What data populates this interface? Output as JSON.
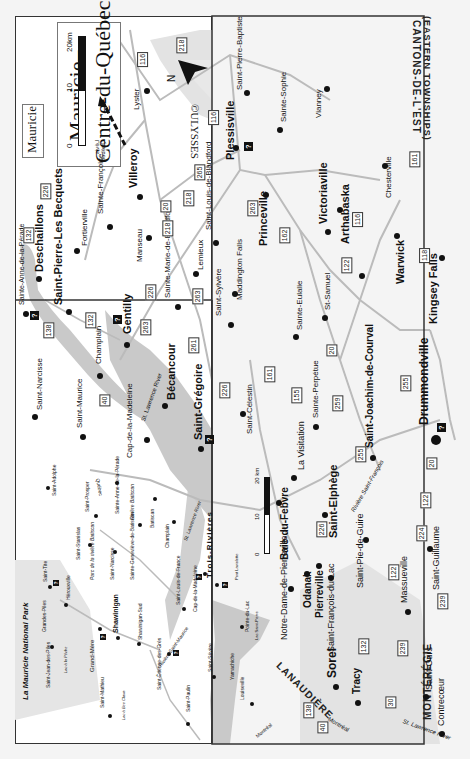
{
  "main_map": {
    "title_line1": "Mauricie–",
    "title_line2": "Centre-du-Québec",
    "scale": {
      "zero": "0",
      "mid": "10",
      "end": "20km"
    },
    "north_label": "N",
    "copyright": "©ULYSSES",
    "region_labels": {
      "eastern_townships_fr": "CANTONS-DE-L'EST",
      "eastern_townships_en": "(EASTERN TOWNSHIPS)",
      "monteregie": "MONTÉRÉGIE",
      "lanaudiere": "LANAUDIÈRE"
    },
    "direction_arrows": {
      "quebec": "Québec",
      "levis": "Lévis",
      "montreal": "Montréal"
    },
    "rivers": {
      "st_lawrence": "St. Lawrence River",
      "saint_francois": "Rivière Saint-François"
    },
    "places": {
      "lyster": "Lyster",
      "plessisville": "Plessisville",
      "saint_pierre_baptiste": "Saint-Pierre-Baptiste",
      "sainte_sophie": "Sainte-Sophie",
      "vianney": "Vianney",
      "chesterville": "Chesterville",
      "villeroy": "Villeroy",
      "sainte_francoise": "Sainte-Françoise",
      "fortierville": "Fortierville",
      "deschaillons": "Deschaillons",
      "saint_pierre_les_becquets": "Saint-Pierre-Les Becquets",
      "manseau": "Manseau",
      "saint_louis_de_blandford": "Saint-Louis-de-Blandford",
      "lemieux": "Lemieux",
      "sainte_marie_de_blandford": "Sainte-Marie-de-Blandford",
      "princeville": "Princeville",
      "victoriaville": "Victoriaville",
      "arthabaska": "Arthabaska",
      "warwick": "Warwick",
      "kingsey_falls": "Kingsey Falls",
      "maddington_falls": "Maddington Falls",
      "saint_sylvere": "Saint-Sylvère",
      "sainte_eulalie": "Sainte-Eulalie",
      "st_samuel": "St-Samuel",
      "gentilly": "Gentilly",
      "sainte_anne_de_la_perade": "Sainte-Anne-de-la-Pérade",
      "champlain": "Champlain",
      "saint_narcisse": "Saint-Narcisse",
      "saint_maurice": "Saint-Maurice",
      "becancour": "Bécancour",
      "saint_gregoire": "Saint-Grégoire",
      "cap_de_la_madeleine": "Cap-de-la-Madeleine",
      "saint_celestin": "Saint-Célestin",
      "sainte_perpetue": "Sainte-Perpétue",
      "la_visitation": "La Visitation",
      "saint_joachim_de_courval": "Saint-Joachim-de-Courval",
      "drummondville": "Drummondville",
      "baie_du_febvre": "Baie-du-Febvre",
      "saint_elphege": "Saint-Elphège",
      "saint_pie_de_guire": "Saint-Pie-de-Guire",
      "saint_guillaume": "Saint-Guillaume",
      "notre_dame_de_pierreville": "Notre-Dame-de-Pierreville",
      "odanak": "Odanak",
      "pierreville": "Pierreville",
      "saint_francois_du_lac": "Saint-François-du-Lac",
      "massueville": "Massueville",
      "sorel": "Sorel",
      "tracy": "Tracy",
      "saint_ours": "Saint-Ours",
      "contrecoeur": "Contrecœur"
    },
    "routes": [
      "116",
      "218",
      "116",
      "265",
      "226",
      "132",
      "218",
      "20",
      "218",
      "263",
      "226",
      "263",
      "132",
      "138",
      "261",
      "263",
      "162",
      "116",
      "122",
      "118",
      "161",
      "40",
      "226",
      "161",
      "155",
      "259",
      "20",
      "255",
      "255",
      "20",
      "122",
      "226",
      "224",
      "122",
      "239",
      "132",
      "239",
      "138",
      "40",
      "30"
    ]
  },
  "inset_map": {
    "title": "Mauricie",
    "scale": {
      "zero": "0",
      "mid": "10",
      "end": "20 km"
    },
    "places": {
      "la_mauricie_national_park": "La Mauricie National Park",
      "saint_adolphe": "Saint-Adolphe",
      "saint_prosper": "Saint-Prosper",
      "sainte_anne_de_la_perade": "Sainte-Anne-de-la-Pérade",
      "batiscan": "Batiscan",
      "champlain": "Champlain",
      "saint_stanislas": "Saint-Stanislas",
      "parc_riviere_batiscan": "Parc de la rivière Batiscan",
      "saint_narcisse": "Saint-Narcisse",
      "sainte_genevieve_de_batiscan": "Sainte-Geneviève-de-Batiscan",
      "saint_tite": "Saint-Tite",
      "herouxville": "Hérouxville",
      "grandes_piles": "Grandes-Piles",
      "saint_jean_des_piles": "Saint-Jean-des-Piles",
      "lac_a_la_peche": "Lac à la Pêche",
      "grand_mere": "Grand-Mère",
      "shawinigan": "Shawinigan",
      "shawinigan_sud": "Shawinigan-Sud",
      "saint_louis_de_france": "Saint-Louis-de-France",
      "cap_de_la_madeleine": "Cap-de-la-Madeleine",
      "trois_rivieres": "Trois-Rivières",
      "pont_laviolette": "Pont Laviolette",
      "saint_mathieu": "Saint-Mathieu",
      "lac_a_bee_clava": "Lac à Bee Clava",
      "saint_etienne_des_gres": "Saint-Étienne-des-Grès",
      "saint_severe": "Saint-Sévère",
      "yamachiche": "Yamachiche",
      "pointe_du_lac": "Pointe-du-Lac",
      "lac_saint_pierre": "Lac Saint-Pierre",
      "saint_paulin": "Saint-Paulin",
      "louiseville": "Louiseville"
    },
    "rivers": {
      "batiscan": "Rivière Batiscan",
      "saint_maurice": "Rivière Saint-Maurice",
      "st_lawrence": "St. Lawrence River"
    },
    "direction_arrows": {
      "quebec": "Québec",
      "montreal": "Montréal"
    }
  },
  "colors": {
    "water": "#c9c9c9",
    "park": "#dcdcdc",
    "road": "#bdbdbd",
    "border": "#333333"
  }
}
